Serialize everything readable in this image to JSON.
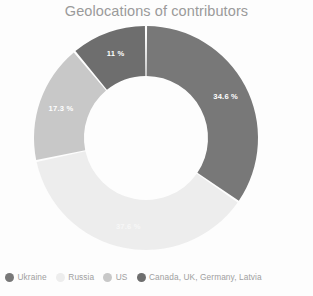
{
  "chart_data": {
    "type": "pie",
    "variant": "donut",
    "title": "Geolocations of contributors",
    "xlabel": "",
    "ylabel": "",
    "unit": "%",
    "legend_position": "bottom",
    "grid": false,
    "start_angle_deg": 0,
    "direction": "clockwise",
    "categories": [
      "Ukraine",
      "Russia",
      "US",
      "Canada, UK, Germany, Latvia"
    ],
    "values": [
      34.6,
      37.1,
      17.3,
      11
    ],
    "labels": [
      "34.6 %",
      "37.6 %",
      "17.3 %",
      "11 %"
    ],
    "colors": [
      "#787878",
      "#ededed",
      "#c8c8c8",
      "#6e6e6e"
    ],
    "slices": [
      {
        "name": "Ukraine",
        "value": 34.6,
        "label": "34.6 %",
        "color": "#787878",
        "label_faint": false
      },
      {
        "name": "Russia",
        "value": 37.1,
        "label": "37.6 %",
        "color": "#ededed",
        "label_faint": true
      },
      {
        "name": "US",
        "value": 17.3,
        "label": "17.3 %",
        "color": "#c8c8c8",
        "label_faint": false
      },
      {
        "name": "Canada, UK, Germany, Latvia",
        "value": 11,
        "label": "11 %",
        "color": "#6e6e6e",
        "label_faint": false
      }
    ]
  },
  "title": {
    "text": "Geolocations of contributors"
  },
  "legend": {
    "items": [
      {
        "label": "Ukraine",
        "color": "#787878"
      },
      {
        "label": "Russia",
        "color": "#ededed"
      },
      {
        "label": "US",
        "color": "#c8c8c8"
      },
      {
        "label": "Canada, UK, Germany, Latvia",
        "color": "#6e6e6e"
      }
    ]
  },
  "slice_labels": {
    "ukraine": "34.6 %",
    "russia": "37.6 %",
    "us": "17.3 %",
    "other": "11 %"
  }
}
